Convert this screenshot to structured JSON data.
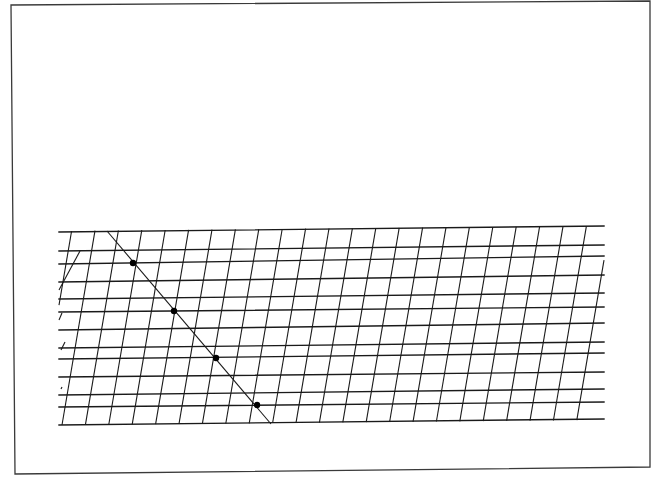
{
  "figure": {
    "width": 665,
    "height": 495,
    "background": "#ffffff",
    "ink": "#1a1a1a",
    "frame": {
      "points": [
        [
          11,
          5
        ],
        [
          650,
          1
        ],
        [
          650,
          467
        ],
        [
          15,
          474
        ]
      ],
      "stroke": "#3a3a3a",
      "stroke_width": 1.3
    },
    "grid": {
      "horizontal_lines": {
        "x_left": 59,
        "x_right": 604,
        "y_left": [
          232,
          251,
          264,
          282,
          299,
          312,
          330,
          348,
          359,
          377,
          395,
          407,
          425
        ],
        "y_right": [
          226,
          245,
          256,
          275,
          293,
          307,
          323,
          342,
          353,
          372,
          389,
          402,
          419
        ],
        "stroke_width": 1.4
      },
      "slanted_lines": {
        "count": 23,
        "top_y_left": 231,
        "top_y_right": 226,
        "bottom_y_left": 425,
        "bottom_y_right": 420,
        "top_x_start": 95,
        "bottom_x_start": 62,
        "spacing": 23.4,
        "stroke_width": 1.1,
        "left_partial_lines": [
          {
            "x1": 59,
            "y1": 290,
            "x2": 80,
            "y2": 251
          },
          {
            "x1": 59,
            "y1": 320,
            "x2": 62,
            "y2": 313
          },
          {
            "x1": 61,
            "y1": 350,
            "x2": 65,
            "y2": 342
          },
          {
            "x1": 61,
            "y1": 389,
            "x2": 62,
            "y2": 387
          }
        ]
      }
    },
    "transversal": {
      "x1": 107,
      "y1": 231,
      "x2": 271,
      "y2": 424,
      "stroke_width": 1.1
    },
    "dots": [
      {
        "cx": 133,
        "cy": 263,
        "r": 3.2
      },
      {
        "cx": 174,
        "cy": 311,
        "r": 3.2
      },
      {
        "cx": 216,
        "cy": 358,
        "r": 3.2
      },
      {
        "cx": 257,
        "cy": 405,
        "r": 3.2
      }
    ]
  }
}
